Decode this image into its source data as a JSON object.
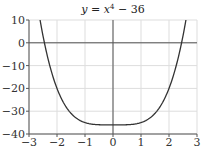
{
  "chart_data": {
    "type": "line",
    "title_parts": {
      "lhs": "y",
      "eq": " = ",
      "var": "x",
      "exp": "4",
      "rest": " − 36"
    },
    "xlabel": "",
    "ylabel": "",
    "xlim": [
      -3,
      3
    ],
    "ylim": [
      -40,
      10
    ],
    "x_ticks": [
      -3,
      -2,
      -1,
      0,
      1,
      2,
      3
    ],
    "x_tick_labels": [
      "−3",
      "−2",
      "−1",
      "0",
      "1",
      "2",
      "3"
    ],
    "y_ticks": [
      -40,
      -30,
      -20,
      -10,
      0,
      10
    ],
    "y_tick_labels": [
      "−40",
      "−30",
      "−20",
      "−10",
      "0",
      "10"
    ],
    "grid": true,
    "legend": null,
    "series": [
      {
        "name": "y = x^4 - 36",
        "function": "x^4 - 36",
        "x": [
          -2.6,
          -2.5,
          -2.25,
          -2,
          -1.75,
          -1.5,
          -1.25,
          -1,
          -0.5,
          0,
          0.5,
          1,
          1.25,
          1.5,
          1.75,
          2,
          2.25,
          2.5,
          2.6
        ],
        "values": [
          9.7,
          3.06,
          -10.37,
          -20,
          -26.62,
          -30.94,
          -33.56,
          -35,
          -35.94,
          -36,
          -35.94,
          -35,
          -33.56,
          -30.94,
          -26.62,
          -20,
          -10.37,
          3.06,
          9.7
        ]
      }
    ],
    "colors": {
      "line": "#333333",
      "axis": "#555555",
      "grid": "#dddddd"
    }
  }
}
